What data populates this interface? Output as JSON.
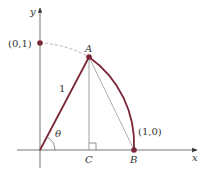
{
  "diagram": {
    "axes": {
      "x_label": "x",
      "y_label": "y"
    },
    "points": {
      "top": {
        "label": "(0,1)"
      },
      "A": {
        "label": "A"
      },
      "B": {
        "label": "B",
        "coord_label": "(1,0)"
      },
      "C": {
        "label": "C"
      }
    },
    "segments": {
      "radius_label": "1"
    },
    "angle": {
      "label": "θ"
    },
    "colors": {
      "accent": "#7a2838",
      "axis": "#555555",
      "thin": "#999999",
      "dashed": "#aaaaaa"
    }
  }
}
